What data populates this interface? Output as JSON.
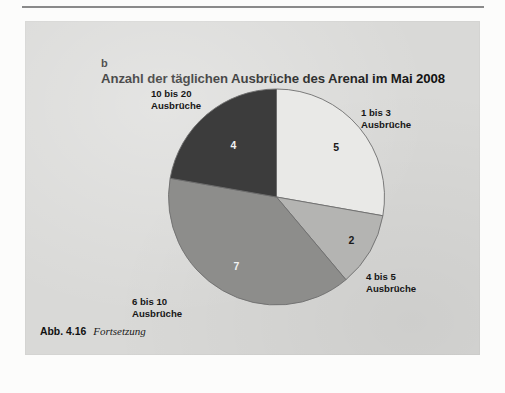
{
  "page": {
    "background_color": "#fcfcfb",
    "panel_color": "#d9d9d7",
    "panel_label": "b"
  },
  "caption": {
    "number": "Abb. 4.16",
    "text": "Fortsetzung"
  },
  "chart_data": {
    "type": "pie",
    "title": "Anzahl der täglichen Ausbrüche des Arenal im Mai 2008",
    "subtitle": "",
    "xlabel": "",
    "ylabel": "",
    "grid": false,
    "legend_position": "callout-labels-around-pie",
    "start_angle_deg": 0,
    "direction": "clockwise",
    "total": 18,
    "categories": [
      "1 bis 3 Ausbrüche",
      "4 bis 5 Ausbrüche",
      "6 bis 10 Ausbrüche",
      "10 bis 20 Ausbrüche"
    ],
    "values": [
      5,
      2,
      7,
      4
    ],
    "colors": [
      "#e9e9e7",
      "#b4b4b2",
      "#8d8d8b",
      "#3c3c3c"
    ],
    "slices": [
      {
        "label": "1 bis 3 Ausbrüche",
        "label_line_1": "1 bis 3",
        "label_line_2": "Ausbrüche",
        "value": 5,
        "value_text": "5",
        "percent": 27.8,
        "color": "#e9e9e7",
        "value_text_color": "dark"
      },
      {
        "label": "4 bis 5 Ausbrüche",
        "label_line_1": "4 bis 5",
        "label_line_2": "Ausbrüche",
        "value": 2,
        "value_text": "2",
        "percent": 11.1,
        "color": "#b4b4b2",
        "value_text_color": "dark"
      },
      {
        "label": "6 bis 10 Ausbrüche",
        "label_line_1": "6 bis 10",
        "label_line_2": "Ausbrüche",
        "value": 7,
        "value_text": "7",
        "percent": 38.9,
        "color": "#8d8d8b",
        "value_text_color": "light"
      },
      {
        "label": "10 bis 20 Ausbrüche",
        "label_line_1": "10 bis 20",
        "label_line_2": "Ausbrüche",
        "value": 4,
        "value_text": "4",
        "percent": 22.2,
        "color": "#3c3c3c",
        "value_text_color": "light"
      }
    ]
  }
}
